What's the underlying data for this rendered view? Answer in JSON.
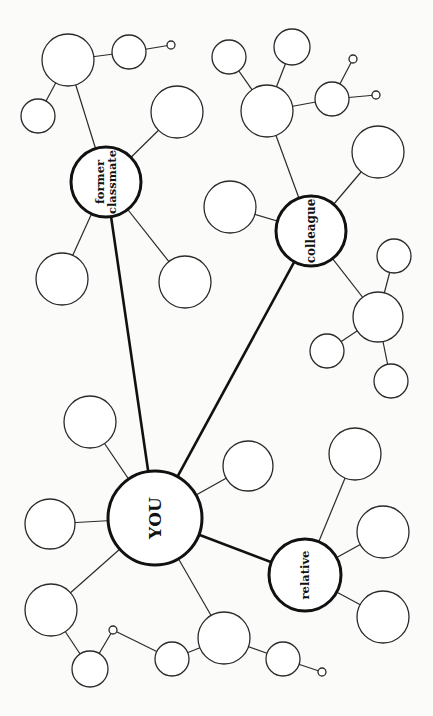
{
  "diagram": {
    "type": "social network mind map",
    "center": {
      "id": "you",
      "label": "YOU",
      "x": 155,
      "y": 518,
      "r": 47,
      "font": 17
    },
    "hubs": [
      {
        "id": "former",
        "lines": [
          "former",
          "classmate"
        ],
        "x": 106,
        "y": 182,
        "r": 35,
        "font": 11.5
      },
      {
        "id": "colleague",
        "lines": [
          "colleague"
        ],
        "x": 311,
        "y": 231,
        "r": 35,
        "font": 12
      },
      {
        "id": "relative",
        "lines": [
          "relative"
        ],
        "x": 305,
        "y": 575,
        "r": 36,
        "font": 11.5
      }
    ],
    "nodes": [
      {
        "id": "a1",
        "x": 68,
        "y": 60,
        "r": 26
      },
      {
        "id": "a2",
        "x": 129,
        "y": 52,
        "r": 17
      },
      {
        "id": "a3",
        "x": 171,
        "y": 45,
        "r": 4
      },
      {
        "id": "a4",
        "x": 38,
        "y": 116,
        "r": 17
      },
      {
        "id": "a5",
        "x": 177,
        "y": 112,
        "r": 26
      },
      {
        "id": "a6",
        "x": 62,
        "y": 279,
        "r": 26
      },
      {
        "id": "a7",
        "x": 185,
        "y": 282,
        "r": 26
      },
      {
        "id": "b1",
        "x": 229,
        "y": 57,
        "r": 17
      },
      {
        "id": "b2",
        "x": 292,
        "y": 47,
        "r": 18
      },
      {
        "id": "b3",
        "x": 267,
        "y": 111,
        "r": 26
      },
      {
        "id": "b4",
        "x": 332,
        "y": 99,
        "r": 17
      },
      {
        "id": "b5",
        "x": 353,
        "y": 59,
        "r": 4
      },
      {
        "id": "b6",
        "x": 376,
        "y": 95,
        "r": 4
      },
      {
        "id": "b7",
        "x": 378,
        "y": 152,
        "r": 26
      },
      {
        "id": "b8",
        "x": 230,
        "y": 207,
        "r": 26
      },
      {
        "id": "b9",
        "x": 378,
        "y": 317,
        "r": 25
      },
      {
        "id": "b10",
        "x": 394,
        "y": 256,
        "r": 17
      },
      {
        "id": "b11",
        "x": 327,
        "y": 351,
        "r": 17
      },
      {
        "id": "b12",
        "x": 391,
        "y": 381,
        "r": 17
      },
      {
        "id": "c1",
        "x": 90,
        "y": 422,
        "r": 26
      },
      {
        "id": "c2",
        "x": 248,
        "y": 466,
        "r": 25
      },
      {
        "id": "c3",
        "x": 50,
        "y": 524,
        "r": 25
      },
      {
        "id": "c4",
        "x": 51,
        "y": 610,
        "r": 26
      },
      {
        "id": "c5",
        "x": 90,
        "y": 669,
        "r": 18
      },
      {
        "id": "c6",
        "x": 113,
        "y": 630,
        "r": 4
      },
      {
        "id": "c7",
        "x": 172,
        "y": 659,
        "r": 17
      },
      {
        "id": "c8",
        "x": 224,
        "y": 638,
        "r": 26
      },
      {
        "id": "c9",
        "x": 283,
        "y": 659,
        "r": 17
      },
      {
        "id": "c10",
        "x": 322,
        "y": 672,
        "r": 4
      },
      {
        "id": "d1",
        "x": 355,
        "y": 454,
        "r": 26
      },
      {
        "id": "d2",
        "x": 383,
        "y": 532,
        "r": 26
      },
      {
        "id": "d3",
        "x": 383,
        "y": 617,
        "r": 26
      }
    ],
    "thick_edges": [
      [
        "you",
        "former"
      ],
      [
        "you",
        "colleague"
      ],
      [
        "you",
        "relative"
      ]
    ],
    "thin_edges": [
      [
        "former",
        "a1"
      ],
      [
        "a1",
        "a2"
      ],
      [
        "a2",
        "a3"
      ],
      [
        "a1",
        "a4"
      ],
      [
        "former",
        "a5"
      ],
      [
        "former",
        "a6"
      ],
      [
        "former",
        "a7"
      ],
      [
        "colleague",
        "b3"
      ],
      [
        "b3",
        "b1"
      ],
      [
        "b3",
        "b2"
      ],
      [
        "b3",
        "b4"
      ],
      [
        "b4",
        "b5"
      ],
      [
        "b4",
        "b6"
      ],
      [
        "colleague",
        "b7"
      ],
      [
        "colleague",
        "b8"
      ],
      [
        "colleague",
        "b9"
      ],
      [
        "b9",
        "b10"
      ],
      [
        "b9",
        "b11"
      ],
      [
        "b9",
        "b12"
      ],
      [
        "you",
        "c1"
      ],
      [
        "you",
        "c2"
      ],
      [
        "you",
        "c3"
      ],
      [
        "you",
        "c4"
      ],
      [
        "c4",
        "c5"
      ],
      [
        "c5",
        "c6"
      ],
      [
        "c6",
        "c7"
      ],
      [
        "you",
        "c8"
      ],
      [
        "c8",
        "c7"
      ],
      [
        "c8",
        "c9"
      ],
      [
        "c9",
        "c10"
      ],
      [
        "relative",
        "d1"
      ],
      [
        "relative",
        "d2"
      ],
      [
        "relative",
        "d3"
      ]
    ]
  }
}
